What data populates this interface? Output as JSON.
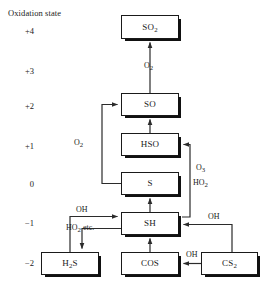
{
  "axis": {
    "title": "Oxidation state",
    "ticks": [
      {
        "label": "+4",
        "y": 26
      },
      {
        "label": "+3",
        "y": 66
      },
      {
        "label": "+2",
        "y": 101
      },
      {
        "label": "+1",
        "y": 141
      },
      {
        "label": "0",
        "y": 179
      },
      {
        "label": "−1",
        "y": 218
      },
      {
        "label": "−2",
        "y": 258
      }
    ]
  },
  "nodes": [
    {
      "id": "so2",
      "label": "SO",
      "sub": "2",
      "x": 121,
      "y": 15,
      "w": 58,
      "h": 24,
      "state": "+4"
    },
    {
      "id": "so",
      "label": "SO",
      "sub": "",
      "x": 121,
      "y": 93,
      "w": 58,
      "h": 23,
      "state": "+2"
    },
    {
      "id": "hso",
      "label": "HSO",
      "sub": "",
      "x": 121,
      "y": 133,
      "w": 58,
      "h": 23,
      "state": "+1"
    },
    {
      "id": "s",
      "label": "S",
      "sub": "",
      "x": 121,
      "y": 172,
      "w": 58,
      "h": 23,
      "state": "0"
    },
    {
      "id": "sh",
      "label": "SH",
      "sub": "",
      "x": 121,
      "y": 212,
      "w": 58,
      "h": 23,
      "state": "−1"
    },
    {
      "id": "h2s",
      "label": "H",
      "sub": "2",
      "suffix": "S",
      "x": 41,
      "y": 252,
      "w": 58,
      "h": 23,
      "state": "−2"
    },
    {
      "id": "cos",
      "label": "COS",
      "sub": "",
      "x": 121,
      "y": 252,
      "w": 58,
      "h": 23,
      "state": "−2"
    },
    {
      "id": "cs2",
      "label": "CS",
      "sub": "2",
      "x": 201,
      "y": 252,
      "w": 57,
      "h": 23,
      "state": "−2"
    }
  ],
  "reagents": [
    {
      "id": "o2-so-to-so2",
      "label": "O",
      "sub": "2",
      "x": 144,
      "y": 62
    },
    {
      "id": "o2-s-to-so",
      "label": "O",
      "sub": "2",
      "x": 74,
      "y": 139
    },
    {
      "id": "oh-h2s-to-sh",
      "label": "OH",
      "sub": "",
      "x": 76,
      "y": 206
    },
    {
      "id": "ho2-sh-to-h2s",
      "label": "HO",
      "sub": "2",
      "suffix": " etc.",
      "x": 66,
      "y": 224
    },
    {
      "id": "o3-sh-to-hso",
      "label": "O",
      "sub": "3",
      "x": 196,
      "y": 164
    },
    {
      "id": "ho2-sh-to-hso",
      "label": "HO",
      "sub": "2",
      "x": 193,
      "y": 179
    },
    {
      "id": "oh-cs2-to-sh",
      "label": "OH",
      "sub": "",
      "x": 208,
      "y": 213
    },
    {
      "id": "oh-cs2-to-cos",
      "label": "OH",
      "sub": "",
      "x": 186,
      "y": 251
    }
  ],
  "edges": [
    {
      "id": "so-to-so2",
      "from": "so",
      "to": "so2"
    },
    {
      "id": "hso-to-so",
      "from": "hso",
      "to": "so"
    },
    {
      "id": "s-to-so",
      "from": "s",
      "to": "so"
    },
    {
      "id": "sh-to-s",
      "from": "sh",
      "to": "s"
    },
    {
      "id": "sh-to-hso",
      "from": "sh",
      "to": "hso"
    },
    {
      "id": "h2s-to-sh",
      "from": "h2s",
      "to": "sh"
    },
    {
      "id": "sh-to-h2s",
      "from": "sh",
      "to": "h2s"
    },
    {
      "id": "cos-to-sh",
      "from": "cos",
      "to": "sh"
    },
    {
      "id": "cs2-to-sh",
      "from": "cs2",
      "to": "sh"
    },
    {
      "id": "cs2-to-cos",
      "from": "cs2",
      "to": "cos"
    }
  ],
  "style": {
    "line": "#2b2b2b",
    "box_border": "#1a1a1a",
    "shadow": "#111111"
  }
}
